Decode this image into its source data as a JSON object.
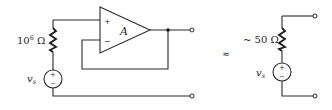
{
  "left_circuit": {
    "resistor_label": "10",
    "resistor_exponent": "6",
    "resistor_unit": "Ω",
    "source_label": "v",
    "source_subscript": "s",
    "source_plus": "+",
    "source_minus": "−",
    "opamp": {
      "gain_label": "A",
      "plus_input": "+",
      "minus_input": "−"
    }
  },
  "approx_symbol": "≈",
  "right_circuit": {
    "resistor_label": "~ 50 Ω",
    "source_label": "v",
    "source_subscript": "s",
    "source_plus": "+",
    "source_minus": "−"
  },
  "colors": {
    "line": "#2a2a2a",
    "background": "#ffffff"
  }
}
